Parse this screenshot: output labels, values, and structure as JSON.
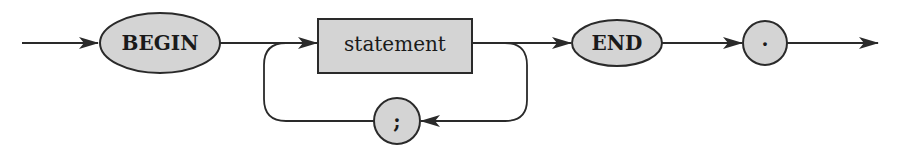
{
  "diagram": {
    "type": "syntax-diagram",
    "nodes": {
      "begin": {
        "label": "BEGIN",
        "kind": "terminal-keyword",
        "shape": "ellipse"
      },
      "statement": {
        "label": "statement",
        "kind": "non-terminal",
        "shape": "rectangle"
      },
      "semicolon": {
        "label": ";",
        "kind": "terminal-symbol",
        "shape": "circle"
      },
      "end": {
        "label": "END",
        "kind": "terminal-keyword",
        "shape": "ellipse"
      },
      "period": {
        "label": ".",
        "kind": "terminal-symbol",
        "shape": "circle"
      }
    },
    "edges": [
      {
        "from": "entry",
        "to": "begin"
      },
      {
        "from": "begin",
        "to": "statement"
      },
      {
        "from": "statement",
        "to": "end"
      },
      {
        "from": "statement",
        "to": "semicolon",
        "note": "loop back"
      },
      {
        "from": "semicolon",
        "to": "statement"
      },
      {
        "from": "end",
        "to": "period"
      },
      {
        "from": "period",
        "to": "exit"
      }
    ],
    "colors": {
      "node_fill": "#d4d4d4",
      "stroke": "#2a2a2a",
      "background": "#ffffff"
    }
  }
}
